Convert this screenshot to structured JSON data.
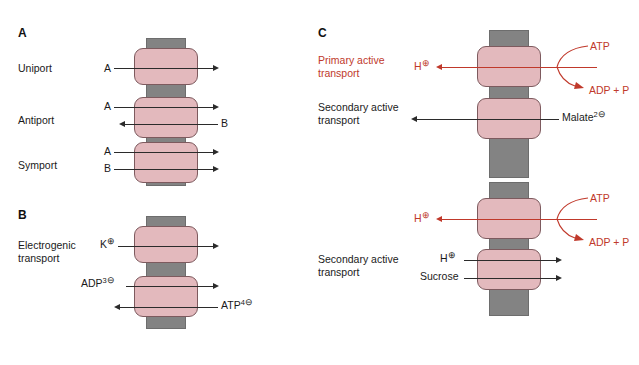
{
  "figure": {
    "background": "#ffffff",
    "membrane_color": "#838383",
    "transporter_color": "#e3b9bd",
    "red_accent": "#c0392b",
    "black_text": "#1a1a1a"
  },
  "panels": {
    "a": {
      "letter": "A",
      "rows": [
        {
          "name": "Uniport",
          "label": "Uniport",
          "in_label": "A",
          "out_labels": []
        },
        {
          "name": "Antiport",
          "label": "Antiport",
          "in_label": "A",
          "second_in_label": "B"
        },
        {
          "name": "Symport",
          "label": "Symport",
          "in_label": "A",
          "second_in_label": "B"
        }
      ]
    },
    "b": {
      "letter": "B",
      "label": "Electrogenic\ntransport",
      "rows": [
        {
          "name": "potassium",
          "species": "K",
          "charge": "⊕"
        },
        {
          "name": "adp",
          "species": "ADP",
          "charge_number": "3",
          "charge": "⊖"
        },
        {
          "name": "atp",
          "species": "ATP",
          "charge_number": "4",
          "charge": "⊖"
        }
      ]
    },
    "c": {
      "letter": "C",
      "top": {
        "primary_label": "Primary active\ntransport",
        "secondary_label": "Secondary active\ntransport",
        "proton": "H",
        "proton_charge": "⊕",
        "atp_label": "ATP",
        "adp_label": "ADP + P",
        "malate": "Malate",
        "malate_charge_number": "2",
        "malate_charge": "⊖"
      },
      "bottom": {
        "secondary_label": "Secondary active\ntransport",
        "proton": "H",
        "proton_charge": "⊕",
        "atp_label": "ATP",
        "adp_label": "ADP + P",
        "proton2": "H",
        "proton2_charge": "⊕",
        "sucrose": "Sucrose"
      }
    }
  }
}
